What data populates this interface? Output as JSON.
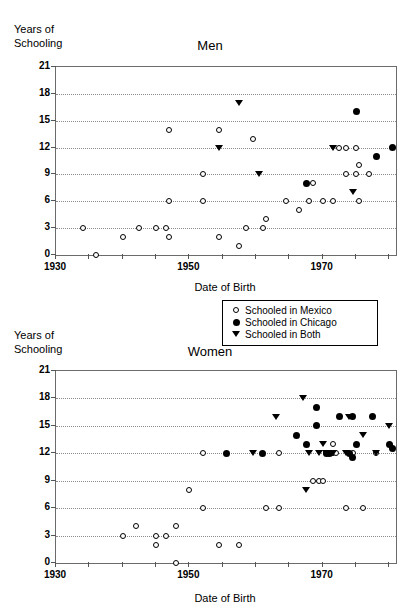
{
  "figure": {
    "axis_y_title": "Years of\nSchooling",
    "axis_x_title": "Date of Birth"
  },
  "legend": {
    "items": [
      {
        "symbol": "open-circle",
        "label": "Schooled in Mexico"
      },
      {
        "symbol": "filled-circle",
        "label": "Schooled in Chicago"
      },
      {
        "symbol": "down-triangle",
        "label": "Schooled in Both"
      }
    ]
  },
  "chart_data": [
    {
      "type": "scatter",
      "title": "Men",
      "xlabel": "Date of Birth",
      "ylabel": "Years of Schooling",
      "xlim": [
        1930,
        1981
      ],
      "ylim": [
        0,
        21
      ],
      "yticks": [
        0,
        3,
        6,
        9,
        12,
        15,
        18,
        21
      ],
      "xticks": [
        1930,
        1935,
        1940,
        1945,
        1950,
        1955,
        1960,
        1965,
        1970,
        1975,
        1980
      ],
      "xtick_labels": [
        "1930",
        "",
        "",
        "",
        "1950",
        "",
        "",
        "",
        "1970",
        "",
        ""
      ],
      "grid": "horizontal-dotted",
      "series": [
        {
          "name": "Schooled in Mexico",
          "marker": "open-circle",
          "points": [
            [
              1934,
              3
            ],
            [
              1936,
              0
            ],
            [
              1940,
              2
            ],
            [
              1942.5,
              3
            ],
            [
              1945,
              3
            ],
            [
              1946.5,
              3
            ],
            [
              1947,
              2
            ],
            [
              1947,
              6
            ],
            [
              1947,
              14
            ],
            [
              1952,
              6
            ],
            [
              1952,
              9
            ],
            [
              1954.5,
              2
            ],
            [
              1954.5,
              14
            ],
            [
              1957.5,
              1
            ],
            [
              1958.5,
              3
            ],
            [
              1959.5,
              13
            ],
            [
              1961,
              3
            ],
            [
              1961.5,
              4
            ],
            [
              1964.5,
              6
            ],
            [
              1966.5,
              5
            ],
            [
              1968,
              6
            ],
            [
              1968.5,
              8
            ],
            [
              1970,
              6
            ],
            [
              1971.5,
              6
            ],
            [
              1972.5,
              12
            ],
            [
              1973.5,
              12
            ],
            [
              1973.5,
              9
            ],
            [
              1975,
              12
            ],
            [
              1975,
              9
            ],
            [
              1975.5,
              10
            ],
            [
              1975.5,
              6
            ],
            [
              1977,
              9
            ]
          ]
        },
        {
          "name": "Schooled in Chicago",
          "marker": "filled-circle",
          "points": [
            [
              1967.5,
              8
            ],
            [
              1975,
              16
            ],
            [
              1978,
              11
            ],
            [
              1980.5,
              12
            ]
          ]
        },
        {
          "name": "Schooled in Both",
          "marker": "down-triangle",
          "points": [
            [
              1954.5,
              12
            ],
            [
              1957.5,
              17
            ],
            [
              1960.5,
              9
            ],
            [
              1971.5,
              12
            ],
            [
              1974.5,
              7
            ]
          ]
        }
      ]
    },
    {
      "type": "scatter",
      "title": "Women",
      "xlabel": "Date of Birth",
      "ylabel": "Years of Schooling",
      "xlim": [
        1930,
        1981
      ],
      "ylim": [
        0,
        21
      ],
      "yticks": [
        0,
        3,
        6,
        9,
        12,
        15,
        18,
        21
      ],
      "xticks": [
        1930,
        1935,
        1940,
        1945,
        1950,
        1955,
        1960,
        1965,
        1970,
        1975,
        1980
      ],
      "xtick_labels": [
        "1930",
        "",
        "",
        "",
        "1950",
        "",
        "",
        "",
        "1970",
        "",
        ""
      ],
      "grid": "horizontal-dotted",
      "series": [
        {
          "name": "Schooled in Mexico",
          "marker": "open-circle",
          "points": [
            [
              1940,
              3
            ],
            [
              1942,
              4
            ],
            [
              1945,
              3
            ],
            [
              1945,
              2
            ],
            [
              1946.5,
              3
            ],
            [
              1948,
              4
            ],
            [
              1948,
              0
            ],
            [
              1950,
              8
            ],
            [
              1952,
              6
            ],
            [
              1952,
              12
            ],
            [
              1954.5,
              2
            ],
            [
              1957.5,
              2
            ],
            [
              1961.5,
              6
            ],
            [
              1963.5,
              6
            ],
            [
              1963.5,
              12
            ],
            [
              1968.5,
              9
            ],
            [
              1969.5,
              9
            ],
            [
              1970,
              9
            ],
            [
              1970.5,
              12
            ],
            [
              1971.5,
              13
            ],
            [
              1971.5,
              12
            ],
            [
              1972,
              12
            ],
            [
              1973.5,
              6
            ],
            [
              1974.5,
              12
            ],
            [
              1976,
              6
            ],
            [
              1978,
              12
            ]
          ]
        },
        {
          "name": "Schooled in Chicago",
          "marker": "filled-circle",
          "points": [
            [
              1955.5,
              12
            ],
            [
              1961,
              12
            ],
            [
              1966,
              14
            ],
            [
              1967.5,
              13
            ],
            [
              1969,
              15
            ],
            [
              1969,
              17
            ],
            [
              1970.5,
              12
            ],
            [
              1971,
              12
            ],
            [
              1972.5,
              16
            ],
            [
              1974,
              12
            ],
            [
              1974.5,
              16
            ],
            [
              1974.5,
              11.5
            ],
            [
              1975,
              13
            ],
            [
              1977.5,
              16
            ],
            [
              1980,
              13
            ],
            [
              1980.5,
              12.5
            ]
          ]
        },
        {
          "name": "Schooled in Both",
          "marker": "down-triangle",
          "points": [
            [
              1959.5,
              12
            ],
            [
              1963,
              16
            ],
            [
              1967,
              18
            ],
            [
              1967.5,
              8
            ],
            [
              1968,
              12
            ],
            [
              1969.5,
              12
            ],
            [
              1970,
              13
            ],
            [
              1970.5,
              12
            ],
            [
              1971.5,
              12
            ],
            [
              1973.5,
              12
            ],
            [
              1974,
              16
            ],
            [
              1976,
              14
            ],
            [
              1978,
              12
            ],
            [
              1980,
              15
            ]
          ]
        }
      ]
    }
  ]
}
